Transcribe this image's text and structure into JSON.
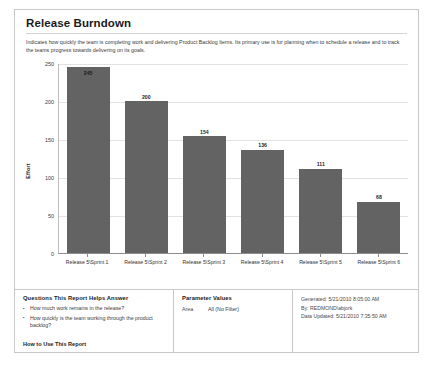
{
  "report": {
    "title": "Release Burndown",
    "description": "Indicates how quickly the team is completing work and delivering Product Backlog Items. Its primary use is for planning when to schedule a release and to track the teams progress towards delivering on its goals."
  },
  "chart_data": {
    "type": "bar",
    "title": "",
    "xlabel": "",
    "ylabel": "Effort",
    "categories": [
      "Release 5\\Sprint 1",
      "Release 5\\Sprint 2",
      "Release 5\\Sprint 3",
      "Release 5\\Sprint 4",
      "Release 5\\Sprint 5",
      "Release 5\\Sprint 6"
    ],
    "values": [
      245,
      200,
      154,
      136,
      111,
      68
    ],
    "ylim": [
      0,
      250
    ],
    "yticks": [
      0,
      50,
      100,
      150,
      200,
      250
    ],
    "grid": true,
    "legend": "none",
    "bar_color": "#636363"
  },
  "questions_panel": {
    "heading": "Questions This Report Helps Answer",
    "items": [
      "How much work remains in the release?",
      "How quickly is the team working through the product backlog?"
    ],
    "how_to_link": "How to Use This Report"
  },
  "parameters_panel": {
    "heading": "Parameter Values",
    "rows": [
      {
        "label": "Area",
        "value": "All (No Filter)"
      }
    ]
  },
  "meta_panel": {
    "generated": "Generated: 5/21/2010 8:05:00 AM",
    "by": "By: REDMOND\\abjork",
    "data_updated": "Data Updated: 5/21/2010 7:35:50 AM"
  }
}
